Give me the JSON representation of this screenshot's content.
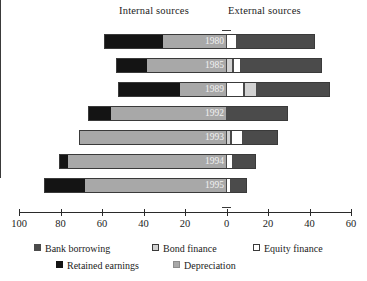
{
  "headers": {
    "internal": "Internal sources",
    "external": "External sources"
  },
  "axis": {
    "tick_labels": [
      "100",
      "80",
      "60",
      "40",
      "20",
      "0",
      "20",
      "40",
      "60"
    ]
  },
  "legend": {
    "row1": [
      {
        "key": "bank",
        "label": "Bank borrowing"
      },
      {
        "key": "bond",
        "label": "Bond finance"
      },
      {
        "key": "equity",
        "label": "Equity finance"
      }
    ],
    "row2": [
      {
        "key": "retained",
        "label": "Retained earnings"
      },
      {
        "key": "depreciation",
        "label": "Depreciation"
      }
    ]
  },
  "years": [
    "1980",
    "1985",
    "1989",
    "1992",
    "1993",
    "1994",
    "1995"
  ],
  "colors": {
    "retained_earnings": "#141414",
    "depreciation": "#a8a8a8",
    "bond_finance": "#d2d2d2",
    "equity_finance": "#ffffff",
    "bank_borrowing": "#4b4b4b",
    "axis": "#2a2a2a"
  },
  "chart_data": {
    "type": "bar",
    "title": "",
    "subtitle": "",
    "orientation": "horizontal",
    "stacked": true,
    "diverging": true,
    "xlabel": "",
    "ylabel": "",
    "xlim": [
      -100,
      60
    ],
    "grid": false,
    "legend_position": "bottom",
    "axis_tick_values": [
      100,
      80,
      60,
      40,
      20,
      0,
      20,
      40,
      60
    ],
    "axis_note": "Left side shows internal sources (percent), right side shows external sources (percent)",
    "categories": [
      "1980",
      "1985",
      "1989",
      "1992",
      "1993",
      "1994",
      "1995"
    ],
    "series": [
      {
        "name": "Retained earnings",
        "side": "internal",
        "values": [
          58,
          30,
          52,
          11,
          0,
          4,
          20
        ]
      },
      {
        "name": "Depreciation",
        "side": "internal",
        "values": [
          30,
          38,
          22,
          55,
          71,
          76,
          68
        ]
      },
      {
        "name": "Bond finance",
        "side": "external",
        "values": [
          0,
          3,
          6,
          0,
          2,
          0,
          0
        ]
      },
      {
        "name": "Equity finance",
        "side": "external",
        "values": [
          5,
          4,
          9,
          0,
          6,
          3,
          2
        ]
      },
      {
        "name": "Bank borrowing",
        "side": "external",
        "values": [
          38,
          39,
          35,
          30,
          17,
          12,
          8
        ]
      }
    ],
    "totals_internal": [
      88,
      68,
      74,
      66,
      71,
      80,
      88
    ],
    "totals_external": [
      43,
      46,
      50,
      30,
      25,
      15,
      10
    ]
  },
  "bars": [
    {
      "year": "1980",
      "top": 4,
      "segments": [
        {
          "key": "retained",
          "start": 104,
          "width": 59
        },
        {
          "key": "depreciation",
          "start": 163,
          "width": 63
        },
        {
          "key": "equity",
          "start": 226,
          "width": 11
        },
        {
          "key": "bank",
          "start": 237,
          "width": 78
        }
      ]
    },
    {
      "year": "1985",
      "top": 28,
      "segments": [
        {
          "key": "retained",
          "start": 116,
          "width": 31
        },
        {
          "key": "depreciation",
          "start": 147,
          "width": 79
        },
        {
          "key": "bond",
          "start": 226,
          "width": 7
        },
        {
          "key": "equity",
          "start": 233,
          "width": 8
        },
        {
          "key": "bank",
          "start": 241,
          "width": 81
        }
      ]
    },
    {
      "year": "1989",
      "top": 52,
      "segments": [
        {
          "key": "retained",
          "start": 118,
          "width": 62
        },
        {
          "key": "depreciation",
          "start": 180,
          "width": 46
        },
        {
          "key": "equity",
          "start": 226,
          "width": 18
        },
        {
          "key": "bond",
          "start": 244,
          "width": 13
        },
        {
          "key": "bank",
          "start": 257,
          "width": 73
        }
      ]
    },
    {
      "year": "1992",
      "top": 76,
      "segments": [
        {
          "key": "retained",
          "start": 88,
          "width": 23
        },
        {
          "key": "depreciation",
          "start": 111,
          "width": 115
        },
        {
          "key": "bank",
          "start": 226,
          "width": 62
        }
      ]
    },
    {
      "year": "1993",
      "top": 100,
      "segments": [
        {
          "key": "depreciation",
          "start": 79,
          "width": 147
        },
        {
          "key": "bond",
          "start": 226,
          "width": 5
        },
        {
          "key": "equity",
          "start": 231,
          "width": 12
        },
        {
          "key": "bank",
          "start": 243,
          "width": 35
        }
      ]
    },
    {
      "year": "1994",
      "top": 124,
      "segments": [
        {
          "key": "retained",
          "start": 59,
          "width": 9
        },
        {
          "key": "depreciation",
          "start": 68,
          "width": 158
        },
        {
          "key": "equity",
          "start": 226,
          "width": 7
        },
        {
          "key": "bank",
          "start": 233,
          "width": 23
        }
      ]
    },
    {
      "year": "1995",
      "top": 148,
      "segments": [
        {
          "key": "retained",
          "start": 44,
          "width": 41
        },
        {
          "key": "depreciation",
          "start": 85,
          "width": 141
        },
        {
          "key": "equity",
          "start": 226,
          "width": 5
        },
        {
          "key": "bank",
          "start": 231,
          "width": 16
        }
      ]
    }
  ],
  "axis_geometry": {
    "left_px": 19,
    "zero_px": 226,
    "right_px": 351,
    "px_per_unit": 2.073
  }
}
